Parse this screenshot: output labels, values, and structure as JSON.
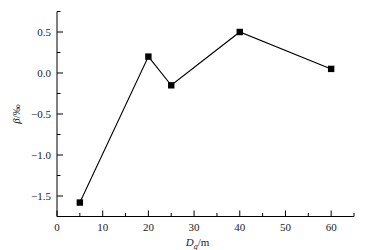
{
  "chart_data": {
    "type": "line",
    "title": "",
    "subtitle": "",
    "xlabel": "D_g/m",
    "xlabel_base": "D",
    "xlabel_sub": "g",
    "xlabel_unit": "/m",
    "ylabel": "β/‰",
    "ylabel_base": "β",
    "ylabel_unit": "/‰",
    "x": [
      5,
      20,
      25,
      40,
      60
    ],
    "values": [
      -1.58,
      0.2,
      -0.15,
      0.5,
      0.05
    ],
    "series": [
      {
        "name": "beta",
        "marker": "filled-square",
        "color": "#000000",
        "points": [
          {
            "x": 5,
            "y": -1.58
          },
          {
            "x": 20,
            "y": 0.2
          },
          {
            "x": 25,
            "y": -0.15
          },
          {
            "x": 40,
            "y": 0.5
          },
          {
            "x": 60,
            "y": 0.05
          }
        ]
      }
    ],
    "xlim": [
      0,
      65
    ],
    "ylim": [
      -1.75,
      0.75
    ],
    "xticks": [
      0,
      10,
      20,
      30,
      40,
      50,
      60
    ],
    "xtick_labels": [
      "0",
      "10",
      "20",
      "30",
      "40",
      "50",
      "60"
    ],
    "x_minor_interval": 5,
    "yticks": [
      0.5,
      0.0,
      -0.5,
      -1.0,
      -1.5
    ],
    "ytick_labels": [
      "0.5",
      "0.0",
      "−0.5",
      "−1.0",
      "−1.5"
    ],
    "y_minor_interval": 0.25,
    "grid": false,
    "legend": false,
    "legend_position": "none",
    "spines": [
      "left",
      "bottom"
    ],
    "tick_direction": "in",
    "line_color": "#000000",
    "background_color": "#ffffff"
  }
}
